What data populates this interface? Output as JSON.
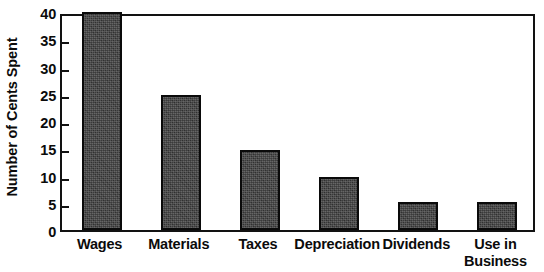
{
  "chart_data": {
    "type": "bar",
    "title": "",
    "xlabel": "",
    "ylabel": "Number of Cents Spent",
    "categories": [
      "Wages",
      "Materials",
      "Taxes",
      "Depreciation",
      "Dividends",
      "Use in\nBusiness"
    ],
    "values": [
      40,
      24.7,
      14.7,
      9.8,
      5.2,
      5.2
    ],
    "ylim": [
      0,
      40
    ],
    "yticks": [
      0,
      5,
      10,
      15,
      20,
      25,
      30,
      35,
      40
    ],
    "ytick_labels": [
      "0",
      "5",
      "10",
      "15",
      "20",
      "25",
      "30",
      "35",
      "40"
    ],
    "grid": false,
    "legend": false,
    "bar_color": "#3b3b3b",
    "bar_edge_color": "#0a0a0a",
    "axis_color": "#121212",
    "background_color": "#ffffff"
  }
}
